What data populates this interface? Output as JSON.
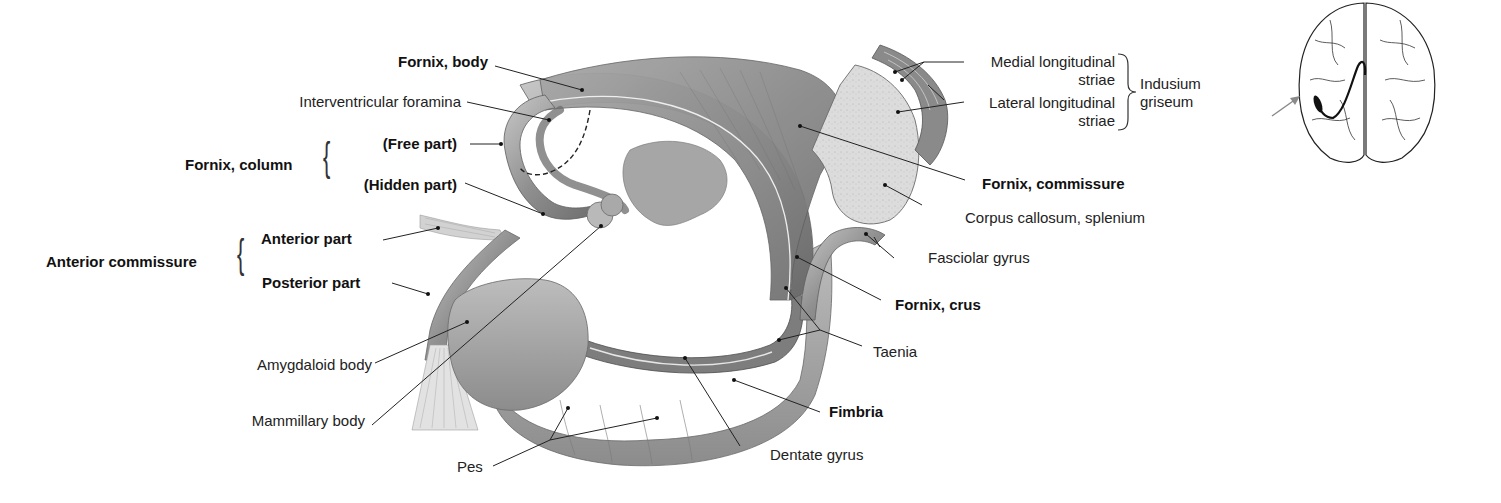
{
  "figure": {
    "type": "anatomical-illustration",
    "colors": {
      "background": "#ffffff",
      "structure_dark": "#6e6e6e",
      "structure_mid": "#9a9a9a",
      "structure_light": "#c4c4c4",
      "splenium_cut": "#dcdcdc",
      "leader_line": "#222222",
      "label_text": "#222222",
      "locator_arrow": "#8a8a8a"
    }
  },
  "labels": {
    "fornix_body": "Fornix, body",
    "interventricular_foramina": "Interventricular foramina",
    "fornix_column": "Fornix, column",
    "free_part": "(Free part)",
    "hidden_part": "(Hidden part)",
    "anterior_commissure": "Anterior commissure",
    "anterior_part": "Anterior part",
    "posterior_part": "Posterior part",
    "amygdaloid_body": "Amygdaloid body",
    "mammillary_body": "Mammillary body",
    "pes": "Pes",
    "dentate_gyrus": "Dentate gyrus",
    "fimbria": "Fimbria",
    "taenia": "Taenia",
    "fornix_crus": "Fornix, crus",
    "fasciolar_gyrus": "Fasciolar gyrus",
    "corpus_callosum_splenium": "Corpus callosum, splenium",
    "fornix_commissure": "Fornix, commissure",
    "medial_longitudinal_striae_1": "Medial longitudinal",
    "medial_longitudinal_striae_2": "striae",
    "lateral_longitudinal_striae_1": "Lateral longitudinal",
    "lateral_longitudinal_striae_2": "striae",
    "indusium_griseum_1": "Indusium",
    "indusium_griseum_2": "griseum"
  },
  "locator": {
    "description": "Superior view of brain with highlighted fornix position",
    "arrow": "pointing-right"
  }
}
